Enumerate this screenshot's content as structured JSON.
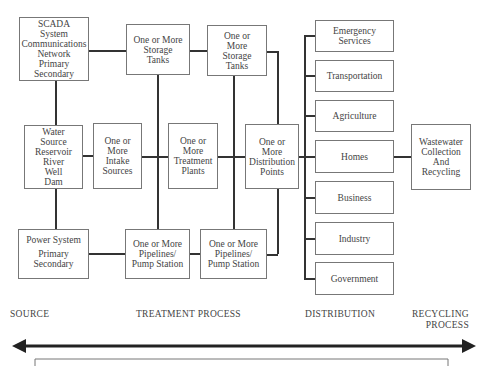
{
  "source": {
    "scada": [
      "SCADA",
      "System",
      "Communications",
      "Network",
      "Primary",
      "Secondary"
    ],
    "water_source": [
      "Water",
      "Source",
      "Reservoir",
      "River",
      "Well",
      "Dam"
    ],
    "power_system": [
      "Power System",
      "Primary",
      "Secondary"
    ]
  },
  "treatment": {
    "storage_tanks_1": [
      "One or More",
      "Storage",
      "Tanks"
    ],
    "storage_tanks_2": [
      "One or",
      "More",
      "Storage",
      "Tanks"
    ],
    "intake_sources": [
      "One or",
      "More",
      "Intake",
      "Sources"
    ],
    "treatment_plants": [
      "One or",
      "More",
      "Treatment",
      "Plants"
    ],
    "distribution_points": [
      "One or",
      "More",
      "Distribution",
      "Points"
    ],
    "pipelines_1": [
      "One or More",
      "Pipelines/",
      "Pump Station"
    ],
    "pipelines_2": [
      "One or More",
      "Pipelines/",
      "Pump Station"
    ]
  },
  "distribution": {
    "consumers": [
      [
        "Emergency",
        "Services"
      ],
      [
        "Transportation"
      ],
      [
        "Agriculture"
      ],
      [
        "Homes"
      ],
      [
        "Business"
      ],
      [
        "Industry"
      ],
      [
        "Government"
      ]
    ]
  },
  "recycling": {
    "wastewater": [
      "Wastewater",
      "Collection",
      "And",
      "Recycling"
    ]
  },
  "stage_labels": {
    "source": "SOURCE",
    "treatment": "TREATMENT PROCESS",
    "distribution": "DISTRIBUTION",
    "recycling_line1": "RECYCLING",
    "recycling_line2": "PROCESS"
  },
  "colors": {
    "line": "#333333",
    "box_border": "#777777",
    "text": "#444444"
  }
}
